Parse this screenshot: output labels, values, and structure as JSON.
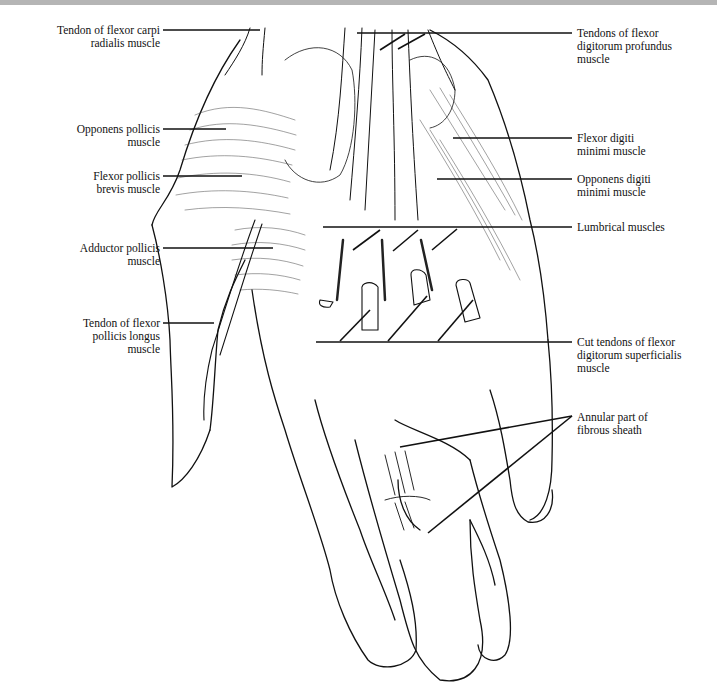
{
  "figure": {
    "colors": {
      "line": "#111111",
      "topbar": "#b5b5b5",
      "background": "#ffffff"
    }
  },
  "labels": {
    "left": [
      {
        "id": "fcr",
        "text": "Tendon of flexor carpi\nradialis muscle",
        "x": 2,
        "y": 24,
        "w": 158
      },
      {
        "id": "opp",
        "text": "Opponens pollicis\nmuscle",
        "x": 2,
        "y": 123,
        "w": 158
      },
      {
        "id": "fpb",
        "text": "Flexor pollicis\nbrevis muscle",
        "x": 2,
        "y": 170,
        "w": 158
      },
      {
        "id": "add",
        "text": "Adductor pollicis\nmuscle",
        "x": 2,
        "y": 242,
        "w": 158
      },
      {
        "id": "fpl",
        "text": "Tendon of flexor\npollicis longus\nmuscle",
        "x": 2,
        "y": 317,
        "w": 158
      }
    ],
    "right": [
      {
        "id": "fdp",
        "text": "Tendons of flexor\ndigitorum profundus\nmuscle",
        "x": 577,
        "y": 27
      },
      {
        "id": "fdm",
        "text": "Flexor digiti\nminimi muscle",
        "x": 577,
        "y": 132
      },
      {
        "id": "odm",
        "text": "Opponens digiti\nminimi muscle",
        "x": 577,
        "y": 173
      },
      {
        "id": "lum",
        "text": "Lumbrical muscles",
        "x": 577,
        "y": 221
      },
      {
        "id": "fds",
        "text": "Cut tendons of flexor\ndigitorum superficialis\nmuscle",
        "x": 577,
        "y": 336
      },
      {
        "id": "ann",
        "text": "Annular part of\nfibrous sheath",
        "x": 577,
        "y": 411
      }
    ]
  },
  "leaders": [
    {
      "id": "fcr",
      "lines": [
        [
          163,
          30,
          260,
          30
        ]
      ]
    },
    {
      "id": "opp",
      "lines": [
        [
          163,
          129,
          226,
          129
        ]
      ]
    },
    {
      "id": "fpb",
      "lines": [
        [
          163,
          176,
          242,
          176
        ]
      ]
    },
    {
      "id": "add",
      "lines": [
        [
          163,
          248,
          273,
          248
        ]
      ]
    },
    {
      "id": "fpl",
      "lines": [
        [
          163,
          323,
          214,
          323
        ]
      ]
    },
    {
      "id": "fdp",
      "lines": [
        [
          357,
          33,
          572,
          33
        ],
        [
          380,
          50,
          405,
          34
        ],
        [
          398,
          49,
          425,
          34
        ]
      ]
    },
    {
      "id": "fdm",
      "lines": [
        [
          453,
          138,
          572,
          138
        ]
      ]
    },
    {
      "id": "odm",
      "lines": [
        [
          437,
          179,
          572,
          179
        ]
      ]
    },
    {
      "id": "lum",
      "lines": [
        [
          323,
          227,
          572,
          227
        ],
        [
          353,
          250,
          380,
          230
        ],
        [
          393,
          251,
          418,
          230
        ],
        [
          432,
          250,
          457,
          229
        ]
      ]
    },
    {
      "id": "fds",
      "lines": [
        [
          316,
          342,
          572,
          342
        ],
        [
          340,
          341,
          370,
          310
        ],
        [
          388,
          341,
          427,
          296
        ],
        [
          438,
          341,
          473,
          300
        ]
      ]
    },
    {
      "id": "ann",
      "lines": [
        [
          572,
          416,
          400,
          447
        ],
        [
          572,
          416,
          428,
          533
        ]
      ]
    }
  ]
}
